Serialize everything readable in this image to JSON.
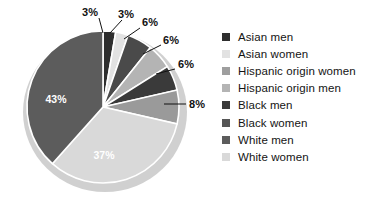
{
  "chart_data": {
    "type": "pie",
    "title": "",
    "subtitle": "",
    "xlabel": "",
    "ylabel": "",
    "legend_position": "right",
    "grid": false,
    "start_angle_deg": 0,
    "direction": "clockwise",
    "units": "percent",
    "categories": [
      "Asian men",
      "Asian women",
      "Hispanic origin women",
      "Hispanic origin men",
      "Black men",
      "Black women",
      "White men",
      "White women"
    ],
    "values": [
      3,
      3,
      6,
      6,
      6,
      8,
      37,
      43
    ],
    "data_labels": [
      "3%",
      "3%",
      "6%",
      "6%",
      "6%",
      "8%",
      "37%",
      "43%"
    ],
    "colors": [
      "#2e2e2e",
      "#e2e2e2",
      "#4a4a4a",
      "#b4b4b4",
      "#3a3a3a",
      "#9a9a9a",
      "#d9d9d9",
      "#5c5c5c"
    ],
    "label_placement": [
      "callout",
      "callout",
      "callout",
      "callout",
      "callout",
      "callout",
      "inside",
      "inside"
    ],
    "slices": [
      {
        "label": "Asian men",
        "value": 3,
        "display": "3%",
        "color": "#2e2e2e"
      },
      {
        "label": "Asian women",
        "value": 3,
        "display": "3%",
        "color": "#e2e2e2"
      },
      {
        "label": "Hispanic origin women",
        "value": 6,
        "display": "6%",
        "color": "#4a4a4a"
      },
      {
        "label": "Hispanic origin men",
        "value": 6,
        "display": "6%",
        "color": "#b4b4b4"
      },
      {
        "label": "Black men",
        "value": 6,
        "display": "6%",
        "color": "#3a3a3a"
      },
      {
        "label": "Black women",
        "value": 8,
        "display": "8%",
        "color": "#9a9a9a"
      },
      {
        "label": "White men",
        "value": 37,
        "display": "37%",
        "color": "#d9d9d9"
      },
      {
        "label": "White women",
        "value": 43,
        "display": "43%",
        "color": "#5c5c5c"
      }
    ]
  },
  "pie_labels": {
    "l_3a": "3%",
    "l_3b": "3%",
    "l_6a": "6%",
    "l_6b": "6%",
    "l_6c": "6%",
    "l_8": "8%",
    "l_37": "37%",
    "l_43": "43%"
  },
  "legend": {
    "items": [
      {
        "label": "Asian men",
        "color": "#2e2e2e"
      },
      {
        "label": "Asian women",
        "color": "#e2e2e2"
      },
      {
        "label": "Hispanic origin women",
        "color": "#9e9e9e"
      },
      {
        "label": "Hispanic origin men",
        "color": "#b4b4b4"
      },
      {
        "label": "Black men",
        "color": "#3a3a3a"
      },
      {
        "label": "Black women",
        "color": "#565656"
      },
      {
        "label": "White men",
        "color": "#5c5c5c"
      },
      {
        "label": "White women",
        "color": "#d9d9d9"
      }
    ]
  }
}
